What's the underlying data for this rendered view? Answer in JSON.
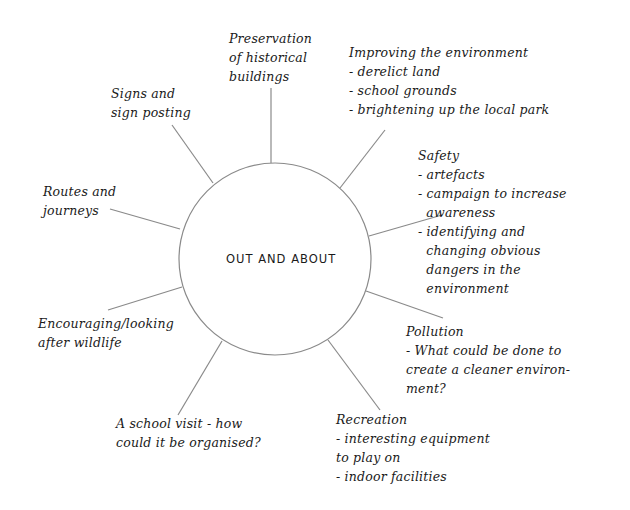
{
  "diagram": {
    "type": "spider-diagram",
    "center": {
      "label": "OUT AND ABOUT",
      "cx": 275,
      "cy": 259,
      "r": 96
    },
    "line_color": "#8a8a8a",
    "text_color": "#1a1a1a",
    "branches": [
      {
        "id": "preservation",
        "lines": [
          "Preservation",
          "of historical",
          "buildings"
        ],
        "pos": {
          "left": 229,
          "top": 29
        },
        "spoke": {
          "x1": 271,
          "y1": 163,
          "x2": 271,
          "y2": 88
        }
      },
      {
        "id": "improving-environment",
        "lines": [
          "Improving the environment",
          "- derelict land",
          "- school grounds",
          "- brightening up the local park"
        ],
        "pos": {
          "left": 349,
          "top": 43
        },
        "spoke": {
          "x1": 340,
          "y1": 188,
          "x2": 385,
          "y2": 130
        }
      },
      {
        "id": "safety",
        "lines": [
          "Safety",
          "- artefacts",
          "- campaign to increase",
          "  awareness",
          "- identifying and",
          "  changing obvious",
          "  dangers in the",
          "  environment"
        ],
        "pos": {
          "left": 418,
          "top": 146
        },
        "spoke": {
          "x1": 369,
          "y1": 236,
          "x2": 442,
          "y2": 215
        }
      },
      {
        "id": "pollution",
        "lines": [
          "Pollution",
          "- What could be done to",
          "create a cleaner environ-",
          "ment?"
        ],
        "pos": {
          "left": 406,
          "top": 322
        },
        "spoke": {
          "x1": 366,
          "y1": 291,
          "x2": 443,
          "y2": 318
        }
      },
      {
        "id": "recreation",
        "lines": [
          "Recreation",
          "- interesting equipment",
          "to play on",
          "- indoor facilities"
        ],
        "pos": {
          "left": 336,
          "top": 410
        },
        "spoke": {
          "x1": 328,
          "y1": 340,
          "x2": 380,
          "y2": 410
        }
      },
      {
        "id": "school-visit",
        "lines": [
          "A school visit - how",
          "could it be organised?"
        ],
        "pos": {
          "left": 116,
          "top": 414
        },
        "spoke": {
          "x1": 222,
          "y1": 341,
          "x2": 178,
          "y2": 415
        }
      },
      {
        "id": "wildlife",
        "lines": [
          "Encouraging/looking",
          "after wildlife"
        ],
        "pos": {
          "left": 38,
          "top": 314
        },
        "spoke": {
          "x1": 182,
          "y1": 287,
          "x2": 108,
          "y2": 310
        }
      },
      {
        "id": "routes",
        "lines": [
          "Routes and",
          "journeys"
        ],
        "pos": {
          "left": 43,
          "top": 182
        },
        "spoke": {
          "x1": 180,
          "y1": 229,
          "x2": 110,
          "y2": 209
        }
      },
      {
        "id": "signs",
        "lines": [
          "Signs and",
          "sign posting"
        ],
        "pos": {
          "left": 111,
          "top": 84
        },
        "spoke": {
          "x1": 213,
          "y1": 183,
          "x2": 172,
          "y2": 125
        }
      }
    ]
  }
}
